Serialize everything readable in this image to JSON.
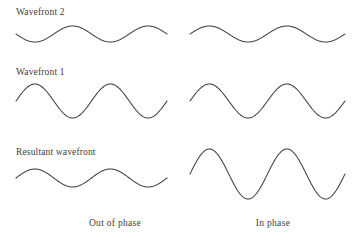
{
  "figure": {
    "background_color": "#ffffff",
    "stroke_color": "#3f3f3f",
    "text_color": "#3d3d3d"
  },
  "labels": {
    "wavefront2": "Wavefront 2",
    "wavefront1": "Wavefront 1",
    "resultant": "Resultant wavefront"
  },
  "captions": {
    "left": "Out of phase",
    "right": "In phase"
  },
  "chart_data": {
    "type": "line",
    "xlabel": "",
    "ylabel": "",
    "grid": false,
    "legend_position": "none",
    "columns": [
      {
        "name": "left",
        "caption": "Out of phase"
      },
      {
        "name": "right",
        "caption": "In phase"
      }
    ],
    "rows": [
      {
        "name": "wavefront2",
        "label": "Wavefront 2"
      },
      {
        "name": "wavefront1",
        "label": "Wavefront 1"
      },
      {
        "name": "resultant",
        "label": "Resultant wavefront"
      }
    ],
    "series": [
      {
        "name": "Wavefront 2 (out of phase)",
        "column": "left",
        "row": "wavefront2",
        "waveform": "sine",
        "amplitude": 8,
        "cycles": 2,
        "phase_degrees": 180,
        "baseline_y": 34,
        "x_start": 16,
        "x_end": 167
      },
      {
        "name": "Wavefront 1 (out of phase)",
        "column": "left",
        "row": "wavefront1",
        "waveform": "sine",
        "amplitude": 17,
        "cycles": 2,
        "phase_degrees": 0,
        "baseline_y": 101,
        "x_start": 16,
        "x_end": 167
      },
      {
        "name": "Resultant (out of phase)",
        "column": "left",
        "row": "resultant",
        "waveform": "sine",
        "amplitude": 9,
        "cycles": 2,
        "phase_degrees": 0,
        "baseline_y": 178,
        "x_start": 16,
        "x_end": 167
      },
      {
        "name": "Wavefront 2 (in phase)",
        "column": "right",
        "row": "wavefront2",
        "waveform": "sine",
        "amplitude": 8,
        "cycles": 2,
        "phase_degrees": 0,
        "baseline_y": 34,
        "x_start": 190,
        "x_end": 345
      },
      {
        "name": "Wavefront 1 (in phase)",
        "column": "right",
        "row": "wavefront1",
        "waveform": "sine",
        "amplitude": 17,
        "cycles": 2,
        "phase_degrees": 0,
        "baseline_y": 101,
        "x_start": 190,
        "x_end": 345
      },
      {
        "name": "Resultant (in phase)",
        "column": "right",
        "row": "resultant",
        "waveform": "sine",
        "amplitude": 25,
        "cycles": 2,
        "phase_degrees": 0,
        "baseline_y": 174,
        "x_start": 190,
        "x_end": 345
      }
    ]
  }
}
